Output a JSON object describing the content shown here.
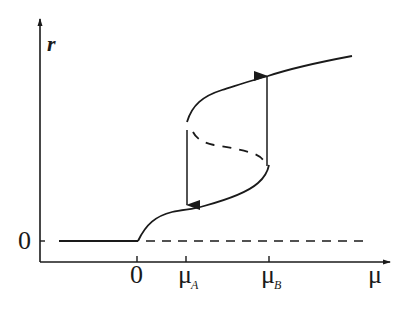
{
  "diagram": {
    "type": "bifurcation-hysteresis",
    "y_axis": {
      "label": "r",
      "zero_label": "0"
    },
    "x_axis": {
      "label": "μ",
      "ticks": [
        {
          "main": "0",
          "sub": ""
        },
        {
          "main": "μ",
          "sub": "A"
        },
        {
          "main": "μ",
          "sub": "B"
        }
      ]
    },
    "branches": {
      "stable_zero": "solid r=0 for μ<0",
      "unstable_zero": "dashed r=0 for μ>0",
      "lower_stable": "solid from 0 up to μ_B",
      "unstable_middle": "dashed between μ_A and μ_B",
      "upper_stable": "solid from μ_A onward"
    },
    "jumps": [
      {
        "at": "μ_A",
        "direction": "down"
      },
      {
        "at": "μ_B",
        "direction": "up"
      }
    ],
    "colors": {
      "line": "#1a1a1a",
      "background": "#ffffff"
    }
  }
}
